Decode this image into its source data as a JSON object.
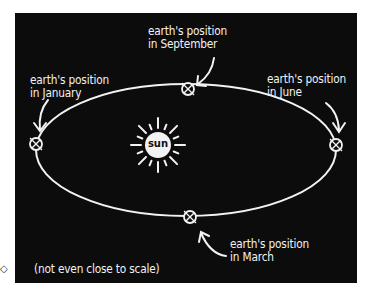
{
  "diagram": {
    "type": "orbit-illustration",
    "colors": {
      "background": "#0c0c0c",
      "ink": "#f2f2f2",
      "page": "#ffffff"
    },
    "sun": {
      "label": "sun"
    },
    "labels": {
      "september": [
        "earth's position",
        "in September"
      ],
      "january": [
        "earth's position",
        "in January"
      ],
      "june": [
        "earth's position",
        "in June"
      ],
      "march": [
        "earth's position",
        "in March"
      ]
    },
    "footnote": "(not even close to scale)",
    "corner_mark": "◇"
  }
}
